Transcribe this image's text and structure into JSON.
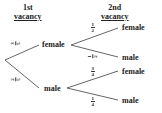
{
  "headers": {
    "first": {
      "line1": "1st",
      "line2": "vacancy"
    },
    "second": {
      "line1": "2nd",
      "line2": "vacancy"
    }
  },
  "tree": {
    "first_level": [
      {
        "label": "female",
        "probability": {
          "num": "3",
          "den": "5"
        }
      },
      {
        "label": "male",
        "probability": {
          "num": "2",
          "den": "5"
        }
      }
    ],
    "second_level": {
      "after_female": [
        {
          "label": "female",
          "probability": {
            "num": "1",
            "den": "2"
          }
        },
        {
          "label": "male",
          "probability": {
            "num": "1",
            "den": "2"
          }
        }
      ],
      "after_male": [
        {
          "label": "female",
          "probability": {
            "num": "3",
            "den": "4"
          }
        },
        {
          "label": "male",
          "probability": {
            "num": "1",
            "den": "4"
          }
        }
      ]
    }
  }
}
